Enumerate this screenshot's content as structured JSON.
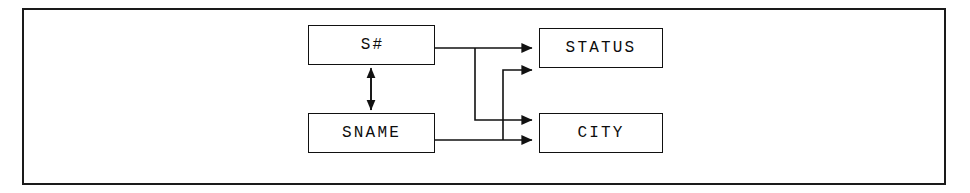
{
  "diagram": {
    "type": "functional-dependency-diagram",
    "title": "",
    "background_color": "#ffffff",
    "line_color": "#111111",
    "border_color": "#1a1a1a",
    "nodes": [
      {
        "id": "skey",
        "label": "S#",
        "x": 308,
        "y": 25,
        "width": 127,
        "height": 40
      },
      {
        "id": "status",
        "label": "STATUS",
        "x": 539,
        "y": 28,
        "width": 124,
        "height": 40
      },
      {
        "id": "sname",
        "label": "SNAME",
        "x": 308,
        "y": 113,
        "width": 127,
        "height": 40
      },
      {
        "id": "city",
        "label": "CITY",
        "x": 539,
        "y": 113,
        "width": 124,
        "height": 40
      }
    ],
    "edges": [
      {
        "from": "skey",
        "to": "status",
        "direction": "one-way",
        "label": ""
      },
      {
        "from": "skey",
        "to": "city",
        "direction": "one-way",
        "label": ""
      },
      {
        "from": "sname",
        "to": "status",
        "direction": "one-way",
        "label": ""
      },
      {
        "from": "sname",
        "to": "city",
        "direction": "one-way",
        "label": ""
      },
      {
        "from": "skey",
        "to": "sname",
        "direction": "two-way",
        "label": ""
      }
    ]
  }
}
